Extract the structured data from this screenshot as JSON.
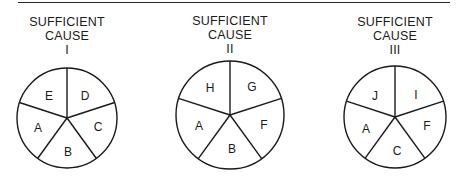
{
  "figure": {
    "pies": [
      {
        "title_line1": "SUFFICIENT",
        "title_line2": "CAUSE",
        "numeral": "I",
        "components": [
          "E",
          "D",
          "C",
          "B",
          "A"
        ]
      },
      {
        "title_line1": "SUFFICIENT",
        "title_line2": "CAUSE",
        "numeral": "II",
        "components": [
          "H",
          "G",
          "F",
          "B",
          "A"
        ]
      },
      {
        "title_line1": "SUFFICIENT",
        "title_line2": "CAUSE",
        "numeral": "III",
        "components": [
          "J",
          "I",
          "F",
          "C",
          "A"
        ]
      }
    ]
  }
}
